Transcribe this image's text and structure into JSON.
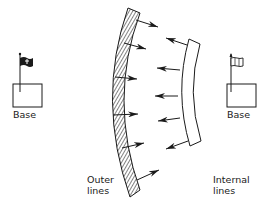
{
  "diagram": {
    "left_base": {
      "label": "Base",
      "flag": "black"
    },
    "right_base": {
      "label": "Base",
      "flag": "white"
    },
    "outer_lines": {
      "label_line1": "Outer",
      "label_line2": "lines",
      "arrow_count": 6,
      "arrow_direction": "inward-right"
    },
    "internal_lines": {
      "label_line1": "Internal",
      "label_line2": "lines",
      "arrow_count": 5,
      "arrow_direction": "inward-left"
    }
  },
  "colors": {
    "ink": "#1a1a1a",
    "background": "#ffffff"
  }
}
